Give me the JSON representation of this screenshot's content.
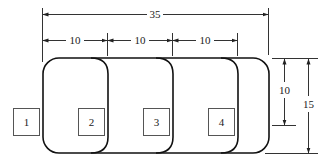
{
  "diagram": {
    "dimensions": {
      "total_width": "35",
      "segment_1": "10",
      "segment_2": "10",
      "segment_3": "10",
      "inner_height": "10",
      "total_height": "15"
    },
    "boxes": [
      {
        "label": "1"
      },
      {
        "label": "2"
      },
      {
        "label": "3"
      },
      {
        "label": "4"
      }
    ],
    "colors": {
      "line": "#222222",
      "background": "#ffffff"
    }
  }
}
